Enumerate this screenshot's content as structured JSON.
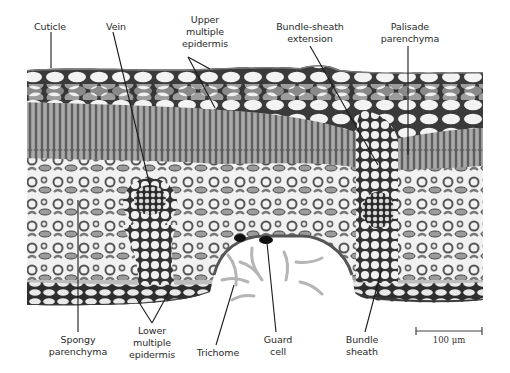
{
  "figure": {
    "labels": {
      "cuticle": {
        "lines": [
          "Cuticle"
        ]
      },
      "vein": {
        "lines": [
          "Vein"
        ]
      },
      "upper_multiple_epidermis": {
        "lines": [
          "Upper",
          "multiple",
          "epidermis"
        ]
      },
      "bundle_sheath_extension": {
        "lines": [
          "Bundle-sheath",
          "extension"
        ]
      },
      "palisade_parenchyma": {
        "lines": [
          "Palisade",
          "parenchyma"
        ]
      },
      "spongy_parenchyma": {
        "lines": [
          "Spongy",
          "parenchyma"
        ]
      },
      "lower_multiple_epidermis": {
        "lines": [
          "Lower",
          "multiple",
          "epidermis"
        ]
      },
      "trichome": {
        "lines": [
          "Trichome"
        ]
      },
      "guard_cell": {
        "lines": [
          "Guard",
          "cell"
        ]
      },
      "bundle_sheath": {
        "lines": [
          "Bundle",
          "sheath"
        ]
      }
    },
    "scale_bar": {
      "label": "100 μm"
    },
    "colors": {
      "background": "#ffffff",
      "cell_wall": "#2b2b2b",
      "cell_lumen": "#f4f4f4",
      "tissue_gray": "#9a9a9a",
      "palisade": "#7d7d7d",
      "air_space": "#eeeeee",
      "trichome": "#b8b8b8",
      "leader_line": "#1a1a1a",
      "label_text": "#2a2a2a"
    }
  }
}
